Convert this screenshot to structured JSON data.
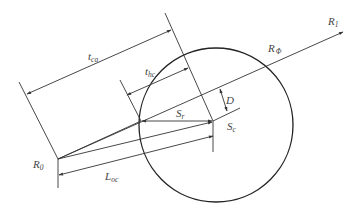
{
  "diagram": {
    "type": "geometric-relation",
    "labels": {
      "t_ca": {
        "main": "t",
        "sub": "ca"
      },
      "t_hc": {
        "main": "t",
        "sub": "hc"
      },
      "R1": {
        "main": "R",
        "sub": "1"
      },
      "R_phi": {
        "main": "R",
        "sub": "Φ"
      },
      "D": {
        "main": "D",
        "sub": ""
      },
      "S_r": {
        "main": "S",
        "sub": "r"
      },
      "S_c": {
        "main": "S",
        "sub": "c"
      },
      "R0": {
        "main": "R",
        "sub": "0"
      },
      "L_oc": {
        "main": "L",
        "sub": "oc"
      }
    },
    "points": {
      "R0": [
        58,
        159
      ],
      "Sc": [
        213,
        121
      ],
      "R1_tip": [
        343,
        32
      ],
      "Sr_left": [
        141,
        121
      ]
    },
    "circle": {
      "cx": 216,
      "cy": 125,
      "r": 77
    },
    "colors": {
      "line": "#333333",
      "text": "#444444",
      "background": "#ffffff"
    }
  }
}
